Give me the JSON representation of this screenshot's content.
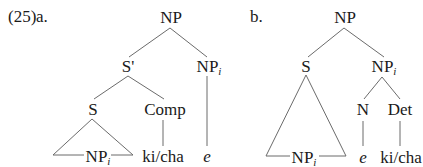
{
  "example_number": "(25)",
  "trees": {
    "a": {
      "label": "a.",
      "root": "NP",
      "s_bar": "S'",
      "np_i": {
        "base": "NP",
        "sub": "i"
      },
      "s": "S",
      "comp": "Comp",
      "triangle_np": {
        "base": "NP",
        "sub": "i"
      },
      "comp_leaf": "ki/cha",
      "empty": "e"
    },
    "b": {
      "label": "b.",
      "root": "NP",
      "s": "S",
      "np_i": {
        "base": "NP",
        "sub": "i"
      },
      "triangle_np": {
        "base": "NP",
        "sub": "i"
      },
      "n": "N",
      "det": "Det",
      "n_leaf": "e",
      "det_leaf": "ki/cha"
    }
  },
  "colors": {
    "text": "#1a1a1a",
    "lines": "#6b6b6b",
    "background": "#ffffff"
  }
}
